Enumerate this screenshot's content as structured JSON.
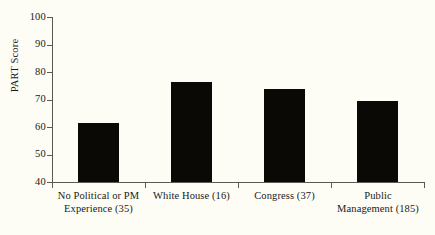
{
  "chart_data": {
    "type": "bar",
    "title": "",
    "xlabel": "",
    "ylabel": "PART Score",
    "categories": [
      "No Political or PM Experience (35)",
      "White House (16)",
      "Congress (37)",
      "Public Management (185)"
    ],
    "values": [
      61.5,
      76.5,
      74,
      69.5
    ],
    "ylim": [
      40,
      100
    ],
    "yticks": [
      40,
      50,
      60,
      70,
      80,
      90,
      100
    ],
    "ytick_labels": [
      "40",
      "50",
      "60",
      "70",
      "80",
      "90",
      "100"
    ],
    "grid": false,
    "legend": null,
    "bar_color": "#0b0906",
    "axis_color": "#5a5a54",
    "background_color": "#fdfdf6"
  },
  "axis": {
    "y_title": "PART Score"
  },
  "labels": {
    "cat0_line1": "No Political or PM",
    "cat0_line2": "Experience (35)",
    "cat1_line1": "White House (16)",
    "cat1_line2": "",
    "cat2_line1": "Congress (37)",
    "cat2_line2": "",
    "cat3_line1": "Public",
    "cat3_line2": "Management (185)"
  }
}
